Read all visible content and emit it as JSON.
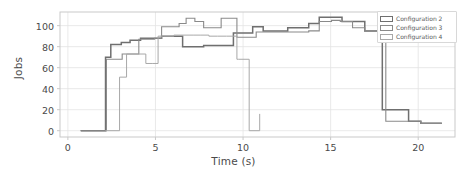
{
  "chart_data": {
    "type": "line",
    "line_style": "step-post",
    "title": "",
    "xlabel": "Time (s)",
    "ylabel": "Jobs",
    "xlim": [
      -0.45,
      22.1
    ],
    "ylim": [
      -6,
      113
    ],
    "xticks": [
      0,
      5,
      10,
      15,
      20
    ],
    "yticks": [
      0,
      20,
      40,
      60,
      80,
      100
    ],
    "xtick_labels": [
      "0",
      "5",
      "10",
      "15",
      "20"
    ],
    "ytick_labels": [
      "0",
      "20",
      "40",
      "60",
      "80",
      "100"
    ],
    "grid": true,
    "grid_color": "#e3e3e3",
    "frame_color": "#c9c9c9",
    "legend_position": "upper right",
    "series": [
      {
        "name": "Configuration 2",
        "color": "#6f6f6f",
        "linewidth": 1.5,
        "x": [
          0.75,
          2.15,
          2.45,
          3.05,
          3.55,
          4.15,
          4.55,
          4.95,
          5.35,
          6.15,
          6.55,
          7.05,
          7.75,
          8.35,
          8.95,
          9.45,
          9.95,
          10.55,
          11.15,
          11.85,
          12.55,
          13.15,
          13.75,
          14.35,
          15.05,
          15.65,
          16.35,
          16.95,
          17.25,
          17.95,
          18.35,
          19.45,
          20.15,
          21.35
        ],
        "y": [
          0,
          70,
          82,
          84,
          86,
          88,
          88,
          88,
          90,
          90,
          80,
          80,
          81,
          81,
          81,
          93,
          93,
          99,
          95,
          95,
          98,
          98,
          102,
          108,
          108,
          104,
          104,
          95,
          95,
          20,
          20,
          9,
          7,
          7
        ]
      },
      {
        "name": "Configuration 3",
        "color": "#8a8a8a",
        "linewidth": 1.1,
        "x": [
          0.7,
          2.2,
          2.6,
          3.1,
          3.55,
          4.05,
          4.55,
          4.95,
          5.35,
          5.85,
          6.35,
          6.75,
          7.25,
          7.75,
          8.25,
          8.75,
          9.15,
          9.65,
          10.15,
          10.75,
          11.35,
          11.95,
          12.55,
          13.15,
          13.75,
          14.35,
          15.05,
          15.55,
          16.25,
          16.95,
          17.35,
          17.95,
          18.15,
          19.45,
          20.15,
          21.35
        ],
        "y": [
          0,
          68,
          68,
          73,
          73,
          87,
          87,
          88,
          99,
          99,
          102,
          107,
          104,
          98,
          98,
          107,
          107,
          89,
          89,
          94,
          94,
          94,
          94,
          94,
          95,
          104,
          105,
          104,
          98,
          95,
          95,
          95,
          9,
          9,
          7,
          7
        ]
      },
      {
        "name": "Configuration 4",
        "color": "#a8a8a8",
        "linewidth": 1.0,
        "x": [
          2.15,
          2.95,
          3.35,
          3.95,
          4.45,
          4.85,
          5.15,
          5.45,
          6.05,
          6.45,
          7.15,
          7.55,
          8.05,
          8.55,
          9.05,
          9.65,
          9.75,
          10.35,
          10.95
        ],
        "y": [
          0,
          51,
          73,
          73,
          64,
          64,
          90,
          90,
          91,
          91,
          91,
          91,
          90,
          90,
          90,
          68,
          68,
          0,
          16
        ]
      }
    ],
    "legend_entries": [
      {
        "label": "Configuration 2"
      },
      {
        "label": "Configuration 3"
      },
      {
        "label": "Configuration 4"
      }
    ]
  },
  "plot_geometry": {
    "left": 60,
    "top": 12,
    "right": 455,
    "bottom": 137
  },
  "legend_geometry": {
    "left": 377,
    "top": 11,
    "width": 80,
    "height": 32
  }
}
